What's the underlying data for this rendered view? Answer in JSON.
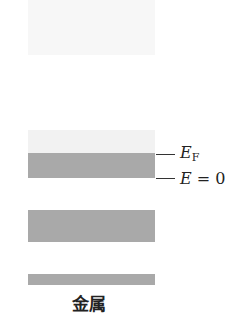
{
  "diagram": {
    "title": "金属",
    "bands": [
      {
        "name": "upper-empty-band",
        "state": "empty",
        "color": "#f7f7f7"
      },
      {
        "name": "partially-filled-band-empty-part",
        "state": "empty",
        "color": "#f2f2f2"
      },
      {
        "name": "partially-filled-band-filled-part",
        "state": "filled",
        "color": "#a9a9a9"
      },
      {
        "name": "lower-filled-band",
        "state": "filled",
        "color": "#a9a9a9"
      },
      {
        "name": "lowest-filled-band",
        "state": "filled",
        "color": "#a9a9a9"
      }
    ],
    "levels": {
      "fermi": {
        "symbol": "E",
        "subscript": "F"
      },
      "zero": {
        "symbol": "E",
        "eq": " = ",
        "value": "0"
      }
    }
  }
}
